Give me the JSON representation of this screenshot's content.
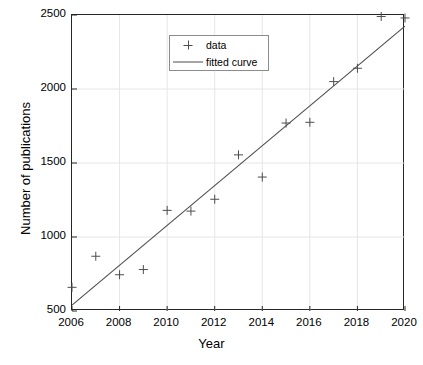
{
  "chart_data": {
    "type": "scatter",
    "title": "",
    "xlabel": "Year",
    "ylabel": "Number of publications",
    "xlim": [
      2006,
      2020
    ],
    "ylim": [
      500,
      2500
    ],
    "xticks": [
      2006,
      2008,
      2010,
      2012,
      2014,
      2016,
      2018,
      2020
    ],
    "xtick_labels": [
      "2006",
      "2008",
      "2010",
      "2012",
      "2014",
      "2016",
      "2018",
      "2020"
    ],
    "yticks": [
      500,
      1000,
      1500,
      2000,
      2500
    ],
    "ytick_labels": [
      "500",
      "1000",
      "1500",
      "2000",
      "2500"
    ],
    "grid": true,
    "legend_position": "top-left",
    "series": [
      {
        "name": "data",
        "type": "scatter",
        "marker": "plus",
        "color": "#4d4d4d",
        "x": [
          2006,
          2007,
          2008,
          2009,
          2010,
          2011,
          2012,
          2013,
          2014,
          2015,
          2016,
          2017,
          2018,
          2019,
          2020
        ],
        "values": [
          660,
          870,
          745,
          780,
          1180,
          1175,
          1255,
          1555,
          1405,
          1770,
          1775,
          2050,
          2140,
          2490,
          2480
        ]
      },
      {
        "name": "fitted curve",
        "type": "line",
        "color": "#4d4d4d",
        "x": [
          2006,
          2020
        ],
        "values": [
          540,
          2425
        ]
      }
    ]
  },
  "axes": {
    "x_title": "Year",
    "y_title": "Number of publications"
  },
  "legend": {
    "entries": [
      {
        "label": "data",
        "key": "plus-marker"
      },
      {
        "label": "fitted curve",
        "key": "line-swatch"
      }
    ]
  },
  "colors": {
    "marker": "#4d4d4d",
    "line": "#4d4d4d",
    "axis": "#262626",
    "grid": "#e6e6e6",
    "background": "#ffffff"
  }
}
